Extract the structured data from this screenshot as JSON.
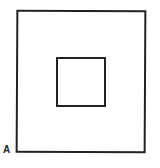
{
  "figure": {
    "label": "A",
    "shapes": [
      {
        "name": "outer-square",
        "stroke": "#222222"
      },
      {
        "name": "inner-square",
        "stroke": "#222222"
      }
    ]
  }
}
